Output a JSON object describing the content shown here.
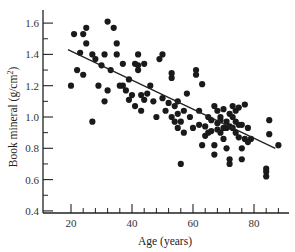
{
  "chart_data": {
    "type": "scatter",
    "title": "",
    "xlabel": "Age (years)",
    "ylabel": "Book mineral (g/cm²)",
    "ylabel_main": "Book mineral (g/cm",
    "ylabel_sup": "2",
    "ylabel_end": ")",
    "xlim": [
      11,
      91
    ],
    "ylim": [
      0.4,
      1.65
    ],
    "x_ticks": [
      20,
      40,
      60,
      80
    ],
    "x_tick_labels": [
      "20",
      "40",
      "60",
      "80"
    ],
    "x_minor_step": 4,
    "y_ticks": [
      0.4,
      0.6,
      0.8,
      1.0,
      1.2,
      1.4,
      1.6
    ],
    "y_tick_labels": [
      "0.4",
      "0.6",
      "0.8",
      "1.0",
      "1.2",
      "1.4",
      "1.6"
    ],
    "y_minor_step": 0.1,
    "grid": false,
    "legend": null,
    "marker_color": "#1a1a1a",
    "line_color": "#222222",
    "regression_line": {
      "x": [
        19,
        87
      ],
      "y": [
        1.43,
        0.8
      ]
    },
    "points": [
      {
        "x": 20,
        "y": 1.2
      },
      {
        "x": 21,
        "y": 1.53
      },
      {
        "x": 22,
        "y": 1.3
      },
      {
        "x": 23,
        "y": 1.41
      },
      {
        "x": 24,
        "y": 1.27
      },
      {
        "x": 24,
        "y": 1.53
      },
      {
        "x": 25,
        "y": 1.47
      },
      {
        "x": 25,
        "y": 1.57
      },
      {
        "x": 27,
        "y": 1.4
      },
      {
        "x": 27,
        "y": 0.97
      },
      {
        "x": 28,
        "y": 1.37
      },
      {
        "x": 29,
        "y": 1.2
      },
      {
        "x": 30,
        "y": 1.33
      },
      {
        "x": 31,
        "y": 1.1
      },
      {
        "x": 31,
        "y": 1.4
      },
      {
        "x": 32,
        "y": 1.61
      },
      {
        "x": 32,
        "y": 1.17
      },
      {
        "x": 33,
        "y": 1.3
      },
      {
        "x": 34,
        "y": 1.57
      },
      {
        "x": 35,
        "y": 1.4
      },
      {
        "x": 35,
        "y": 1.47
      },
      {
        "x": 36,
        "y": 1.2
      },
      {
        "x": 37,
        "y": 1.34
      },
      {
        "x": 37,
        "y": 1.2
      },
      {
        "x": 38,
        "y": 1.17
      },
      {
        "x": 39,
        "y": 1.11
      },
      {
        "x": 39,
        "y": 1.24
      },
      {
        "x": 40,
        "y": 1.14
      },
      {
        "x": 41,
        "y": 1.07
      },
      {
        "x": 41,
        "y": 1.34
      },
      {
        "x": 42,
        "y": 1.33
      },
      {
        "x": 42,
        "y": 1.4
      },
      {
        "x": 42,
        "y": 1.3
      },
      {
        "x": 43,
        "y": 1.14
      },
      {
        "x": 43,
        "y": 1.04
      },
      {
        "x": 44,
        "y": 1.34
      },
      {
        "x": 44,
        "y": 1.11
      },
      {
        "x": 45,
        "y": 1.15
      },
      {
        "x": 46,
        "y": 1.2
      },
      {
        "x": 47,
        "y": 1.1
      },
      {
        "x": 48,
        "y": 1.0
      },
      {
        "x": 49,
        "y": 1.37
      },
      {
        "x": 50,
        "y": 1.4
      },
      {
        "x": 50,
        "y": 1.12
      },
      {
        "x": 51,
        "y": 1.04
      },
      {
        "x": 52,
        "y": 1.09
      },
      {
        "x": 53,
        "y": 1.28
      },
      {
        "x": 53,
        "y": 1.25
      },
      {
        "x": 53,
        "y": 1.0
      },
      {
        "x": 54,
        "y": 0.97
      },
      {
        "x": 54,
        "y": 1.07
      },
      {
        "x": 55,
        "y": 1.02
      },
      {
        "x": 55,
        "y": 1.1
      },
      {
        "x": 55,
        "y": 0.93
      },
      {
        "x": 56,
        "y": 0.97
      },
      {
        "x": 56,
        "y": 0.7
      },
      {
        "x": 57,
        "y": 1.04
      },
      {
        "x": 57,
        "y": 0.9
      },
      {
        "x": 58,
        "y": 1.15
      },
      {
        "x": 59,
        "y": 1.0
      },
      {
        "x": 60,
        "y": 0.93
      },
      {
        "x": 61,
        "y": 1.27
      },
      {
        "x": 61,
        "y": 1.3
      },
      {
        "x": 62,
        "y": 0.95
      },
      {
        "x": 62,
        "y": 1.04
      },
      {
        "x": 63,
        "y": 1.21
      },
      {
        "x": 63,
        "y": 0.82
      },
      {
        "x": 64,
        "y": 0.94
      },
      {
        "x": 64,
        "y": 0.88
      },
      {
        "x": 65,
        "y": 1.0
      },
      {
        "x": 65,
        "y": 0.9
      },
      {
        "x": 66,
        "y": 0.98
      },
      {
        "x": 66,
        "y": 0.91
      },
      {
        "x": 67,
        "y": 0.82
      },
      {
        "x": 67,
        "y": 1.07
      },
      {
        "x": 67,
        "y": 0.76
      },
      {
        "x": 68,
        "y": 0.96
      },
      {
        "x": 68,
        "y": 1.04
      },
      {
        "x": 68,
        "y": 0.92
      },
      {
        "x": 69,
        "y": 0.98
      },
      {
        "x": 69,
        "y": 0.9
      },
      {
        "x": 69,
        "y": 1.0
      },
      {
        "x": 70,
        "y": 0.93
      },
      {
        "x": 70,
        "y": 1.05
      },
      {
        "x": 70,
        "y": 0.86
      },
      {
        "x": 71,
        "y": 0.97
      },
      {
        "x": 71,
        "y": 0.93
      },
      {
        "x": 71,
        "y": 0.8
      },
      {
        "x": 72,
        "y": 0.73
      },
      {
        "x": 72,
        "y": 0.7
      },
      {
        "x": 72,
        "y": 1.02
      },
      {
        "x": 72,
        "y": 0.94
      },
      {
        "x": 73,
        "y": 1.07
      },
      {
        "x": 73,
        "y": 1.0
      },
      {
        "x": 73,
        "y": 0.93
      },
      {
        "x": 74,
        "y": 0.97
      },
      {
        "x": 74,
        "y": 1.04
      },
      {
        "x": 74,
        "y": 0.9
      },
      {
        "x": 75,
        "y": 1.06
      },
      {
        "x": 75,
        "y": 0.87
      },
      {
        "x": 75,
        "y": 0.95
      },
      {
        "x": 76,
        "y": 0.95
      },
      {
        "x": 76,
        "y": 0.8
      },
      {
        "x": 76,
        "y": 0.73
      },
      {
        "x": 77,
        "y": 1.08
      },
      {
        "x": 77,
        "y": 0.86
      },
      {
        "x": 78,
        "y": 0.84
      },
      {
        "x": 78,
        "y": 0.93
      },
      {
        "x": 79,
        "y": 0.86
      },
      {
        "x": 84,
        "y": 0.65
      },
      {
        "x": 84,
        "y": 0.62
      },
      {
        "x": 84,
        "y": 0.67
      },
      {
        "x": 85,
        "y": 0.98
      },
      {
        "x": 85,
        "y": 0.89
      },
      {
        "x": 88,
        "y": 0.82
      }
    ]
  }
}
